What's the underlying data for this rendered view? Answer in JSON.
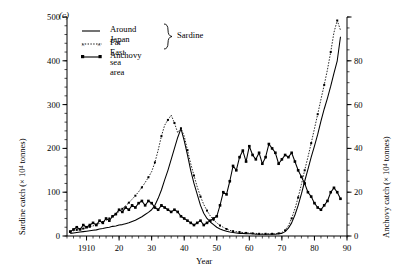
{
  "panel_label": "(c)",
  "axes": {
    "x": {
      "label": "Year",
      "ticks": [
        "1910",
        "20",
        "30",
        "40",
        "50",
        "60",
        "70",
        "80",
        "90"
      ],
      "range": [
        1904,
        1990
      ],
      "tick_values": [
        1910,
        1920,
        1930,
        1940,
        1950,
        1960,
        1970,
        1980,
        1990
      ],
      "minor_step": 2
    },
    "y_left": {
      "label_main": "Sardine catch (",
      "label_mult": "× 10",
      "label_exp": "4",
      "label_unit": " tonnes)",
      "label_full": "Sardine catch (× 10⁴ tonnes)",
      "ticks": [
        "0",
        "100",
        "200",
        "300",
        "400",
        "500"
      ],
      "tick_values": [
        0,
        100,
        200,
        300,
        400,
        500
      ],
      "range": [
        0,
        500
      ],
      "minor_step": 20
    },
    "y_right": {
      "label_full": "Anchovy catch (× 10⁴ tonnes)",
      "ticks": [
        "0",
        "20",
        "40",
        "60",
        "80"
      ],
      "tick_values": [
        0,
        20,
        40,
        60,
        80,
        100
      ],
      "range": [
        0,
        100
      ],
      "minor_step": 5
    }
  },
  "legend": {
    "brace_label": "Sardine",
    "entries": [
      {
        "label": "Around Japan",
        "style": "solid-line",
        "marker": "none"
      },
      {
        "label": "Far East sea area",
        "style": "dotted-line",
        "marker": "cross"
      },
      {
        "label": "Anchovy",
        "style": "solid-line-dots",
        "marker": "square"
      }
    ]
  },
  "colors": {
    "ink": "#000000",
    "background": "#ffffff"
  },
  "chart_data": {
    "type": "line",
    "title": "",
    "subtitle": "",
    "xlabel": "Year",
    "ylabel": "Sardine catch (× 10⁴ tonnes)",
    "y2label": "Anchovy catch (× 10⁴ tonnes)",
    "xlim": [
      1904,
      1990
    ],
    "ylim": [
      0,
      500
    ],
    "y2lim": [
      0,
      100
    ],
    "grid": false,
    "legend_position": "top-left",
    "x": [
      1905,
      1906,
      1907,
      1908,
      1909,
      1910,
      1911,
      1912,
      1913,
      1914,
      1915,
      1916,
      1917,
      1918,
      1919,
      1920,
      1921,
      1922,
      1923,
      1924,
      1925,
      1926,
      1927,
      1928,
      1929,
      1930,
      1931,
      1932,
      1933,
      1934,
      1935,
      1936,
      1937,
      1938,
      1939,
      1940,
      1941,
      1942,
      1943,
      1944,
      1945,
      1946,
      1947,
      1948,
      1949,
      1950,
      1951,
      1952,
      1953,
      1954,
      1955,
      1956,
      1957,
      1958,
      1959,
      1960,
      1961,
      1962,
      1963,
      1964,
      1965,
      1966,
      1967,
      1968,
      1969,
      1970,
      1971,
      1972,
      1973,
      1974,
      1975,
      1976,
      1977,
      1978,
      1979,
      1980,
      1981,
      1982,
      1983,
      1984,
      1985,
      1986,
      1987,
      1988
    ],
    "series": [
      {
        "name": "Around Japan",
        "axis": "left",
        "unit": "× 10⁴ tonnes",
        "values": [
          6,
          7,
          8,
          9,
          10,
          11,
          12,
          13,
          14,
          16,
          17,
          19,
          20,
          22,
          23,
          25,
          26,
          28,
          30,
          33,
          36,
          40,
          44,
          49,
          54,
          60,
          70,
          86,
          105,
          128,
          150,
          175,
          200,
          225,
          245,
          218,
          185,
          150,
          120,
          95,
          70,
          52,
          40,
          32,
          26,
          20,
          16,
          13,
          11,
          9,
          8,
          7,
          6,
          6,
          5,
          5,
          5,
          4,
          4,
          4,
          4,
          4,
          4,
          4,
          5,
          6,
          10,
          18,
          30,
          48,
          70,
          96,
          125,
          152,
          180,
          205,
          232,
          262,
          290,
          315,
          342,
          372,
          400,
          455
        ]
      },
      {
        "name": "Far East sea area",
        "axis": "left",
        "unit": "× 10⁴ tonnes",
        "values": [
          10,
          12,
          14,
          15,
          17,
          19,
          21,
          23,
          26,
          29,
          32,
          36,
          40,
          45,
          50,
          56,
          62,
          69,
          76,
          84,
          92,
          101,
          111,
          122,
          134,
          147,
          168,
          196,
          228,
          253,
          265,
          276,
          258,
          236,
          246,
          228,
          196,
          165,
          138,
          112,
          90,
          72,
          58,
          46,
          37,
          30,
          24,
          20,
          16,
          13,
          11,
          10,
          9,
          8,
          7,
          7,
          6,
          6,
          5,
          5,
          5,
          5,
          5,
          5,
          6,
          8,
          13,
          24,
          40,
          62,
          88,
          118,
          150,
          180,
          212,
          245,
          278,
          312,
          345,
          380,
          420,
          465,
          492,
          470
        ]
      },
      {
        "name": "Anchovy",
        "axis": "right",
        "unit": "× 10⁴ tonnes",
        "values": [
          2,
          3,
          4,
          3,
          5,
          4,
          5,
          6,
          5,
          7,
          6,
          8,
          7,
          9,
          10,
          12,
          11,
          13,
          12,
          14,
          13,
          15,
          16,
          14,
          16,
          15,
          13,
          12,
          14,
          13,
          12,
          11,
          12,
          11,
          9,
          8,
          7,
          6,
          5,
          6,
          7,
          5,
          6,
          7,
          8,
          9,
          14,
          20,
          19,
          25,
          32,
          30,
          36,
          39,
          34,
          41,
          37,
          35,
          38,
          33,
          36,
          42,
          40,
          38,
          33,
          35,
          37,
          36,
          38,
          34,
          30,
          27,
          24,
          20,
          18,
          15,
          13,
          12,
          14,
          16,
          20,
          22,
          20,
          17
        ]
      }
    ]
  }
}
